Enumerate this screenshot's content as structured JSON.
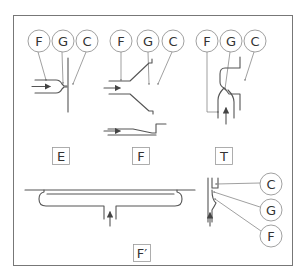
{
  "diagram": {
    "callout_labels": {
      "E": [
        "F",
        "G",
        "C"
      ],
      "F": [
        "F",
        "G",
        "C"
      ],
      "T": [
        "F",
        "G",
        "C"
      ],
      "F_prime_side": [
        "C",
        "G",
        "F"
      ]
    },
    "panel_labels": {
      "E": "E",
      "F": "F",
      "T": "T",
      "F_prime": "F′"
    },
    "colors": {
      "line": "#555555",
      "leader": "#777777",
      "frame": "#777777",
      "background": "#ffffff"
    }
  }
}
